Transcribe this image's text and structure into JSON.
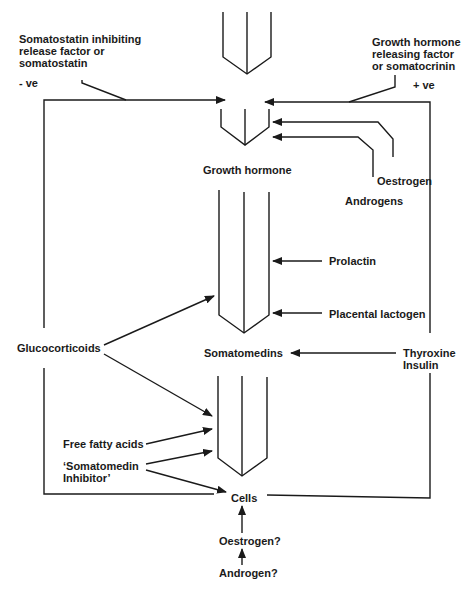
{
  "diagram": {
    "labels": {
      "ghrih": "Somatostatin inhibiting\nrelease factor or\nsomatostatin",
      "neg": "-  ve",
      "ghrh": "Growth hormone\nreleasing factor\nor somatocrinin",
      "pos": "+  ve",
      "growth_hormone": "Growth hormone",
      "oestrogen": "Oestrogen",
      "androgens": "Androgens",
      "prolactin": "Prolactin",
      "placental_lactogen": "Placental lactogen",
      "glucocorticoids": "Glucocorticoids",
      "somatomedins": "Somatomedins",
      "thyroxine_insulin": "Thyroxine\nInsulin",
      "free_fatty_acids": "Free fatty acids",
      "somatomedin_inhibitor": "‘Somatomedin\nInhibitor’",
      "cells": "Cells",
      "oestrogen_q": "Oestrogen?",
      "androgen_q": "Androgen?"
    },
    "colors": {
      "stroke": "#1a1a1a",
      "background": "#ffffff"
    }
  }
}
